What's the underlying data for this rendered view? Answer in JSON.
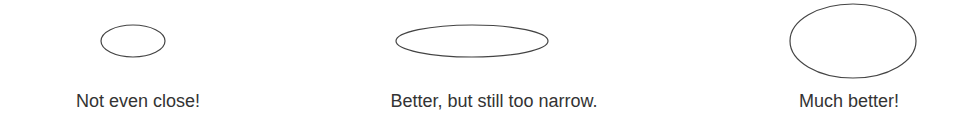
{
  "panels": [
    {
      "caption": "Not even close!",
      "ellipse": {
        "cx": 133,
        "cy": 41,
        "rx": 32,
        "ry": 16
      },
      "caption_center_x": 138
    },
    {
      "caption": "Better, but still too narrow.",
      "ellipse": {
        "cx": 472,
        "cy": 41,
        "rx": 76,
        "ry": 16
      },
      "caption_center_x": 494
    },
    {
      "caption": "Much better!",
      "ellipse": {
        "cx": 853,
        "cy": 41,
        "rx": 63,
        "ry": 37
      },
      "caption_center_x": 849
    }
  ],
  "colors": {
    "stroke": "#444444",
    "text": "#333333",
    "background": "#ffffff"
  }
}
